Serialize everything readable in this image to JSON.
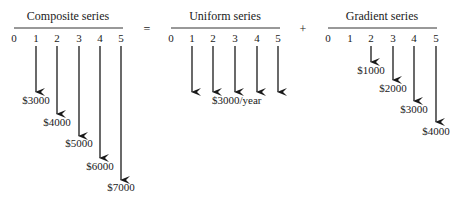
{
  "operators": {
    "equals": "=",
    "plus": "+"
  },
  "panels": [
    {
      "title": "Composite series",
      "periods": [
        "0",
        "1",
        "2",
        "3",
        "4",
        "5"
      ],
      "flows": [
        {
          "period": "1",
          "label": "$3000",
          "value": 3000
        },
        {
          "period": "2",
          "label": "$4000",
          "value": 4000
        },
        {
          "period": "3",
          "label": "$5000",
          "value": 5000
        },
        {
          "period": "4",
          "label": "$6000",
          "value": 6000
        },
        {
          "period": "5",
          "label": "$7000",
          "value": 7000
        }
      ]
    },
    {
      "title": "Uniform series",
      "periods": [
        "0",
        "1",
        "2",
        "3",
        "4",
        "5"
      ],
      "label": "$3000/year",
      "flows": [
        {
          "period": "1",
          "value": 3000
        },
        {
          "period": "2",
          "value": 3000
        },
        {
          "period": "3",
          "value": 3000
        },
        {
          "period": "4",
          "value": 3000
        },
        {
          "period": "5",
          "value": 3000
        }
      ]
    },
    {
      "title": "Gradient series",
      "periods": [
        "0",
        "1",
        "2",
        "3",
        "4",
        "5"
      ],
      "flows": [
        {
          "period": "2",
          "label": "$1000",
          "value": 1000
        },
        {
          "period": "3",
          "label": "$2000",
          "value": 2000
        },
        {
          "period": "4",
          "label": "$3000",
          "value": 3000
        },
        {
          "period": "5",
          "label": "$4000",
          "value": 4000
        }
      ]
    }
  ]
}
